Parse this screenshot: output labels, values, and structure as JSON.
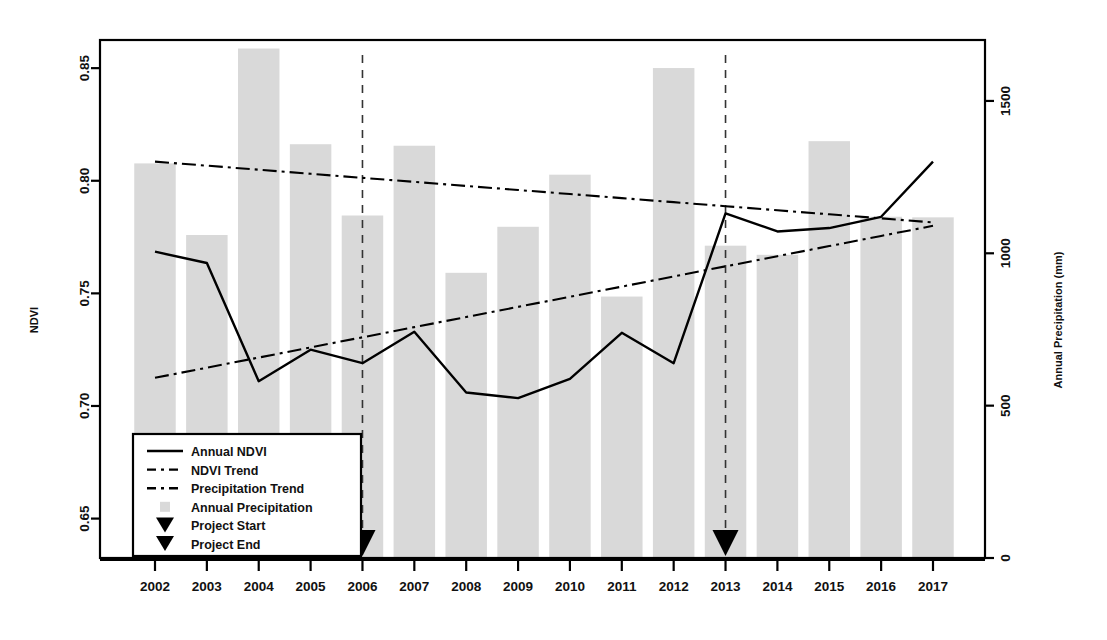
{
  "chart_data": {
    "type": "bar",
    "title": "",
    "xlabel": "",
    "ylabel": "NDVI",
    "y2label": "Annual Precipitation (mm)",
    "categories": [
      "2002",
      "2003",
      "2004",
      "2005",
      "2006",
      "2007",
      "2008",
      "2009",
      "2010",
      "2011",
      "2012",
      "2013",
      "2014",
      "2015",
      "2016",
      "2017"
    ],
    "ylim": [
      0.6325,
      0.8625
    ],
    "y2lim": [
      0,
      1700
    ],
    "yticks": [
      "0.65",
      "0.70",
      "0.75",
      "0.80",
      "0.85"
    ],
    "ytick_values": [
      0.65,
      0.7,
      0.75,
      0.8,
      0.85
    ],
    "y2ticks": [
      "0",
      "500",
      "1000",
      "1500"
    ],
    "y2tick_values": [
      0,
      500,
      1000,
      1500
    ],
    "grid": false,
    "legend_position": "bottom-left",
    "series": [
      {
        "name": "Annual Precipitation",
        "type": "bar",
        "axis": "right",
        "color": "#d9d9d9",
        "values": [
          1295,
          1060,
          1672,
          1358,
          1124,
          1353,
          936,
          1087,
          1258,
          858,
          1608,
          1025,
          995,
          1368,
          1120,
          1118
        ]
      },
      {
        "name": "Annual NDVI",
        "type": "line",
        "axis": "left",
        "color": "#000000",
        "values": [
          0.7685,
          0.7635,
          0.711,
          0.725,
          0.719,
          0.733,
          0.706,
          0.7035,
          0.712,
          0.7325,
          0.719,
          0.7855,
          0.7775,
          0.779,
          0.784,
          0.8085
        ]
      },
      {
        "name": "NDVI Trend",
        "type": "line",
        "axis": "left",
        "color": "#000000",
        "values": [
          0.8085,
          0.8067,
          0.8049,
          0.8031,
          0.8013,
          0.7995,
          0.7977,
          0.7959,
          0.7941,
          0.7923,
          0.7905,
          0.7887,
          0.7869,
          0.7851,
          0.7833,
          0.7815
        ]
      },
      {
        "name": "Precipitation Trend",
        "type": "line",
        "axis": "left",
        "color": "#000000",
        "values": [
          0.7125,
          0.717,
          0.7215,
          0.726,
          0.7305,
          0.735,
          0.7395,
          0.744,
          0.7485,
          0.753,
          0.7575,
          0.762,
          0.7665,
          0.771,
          0.7755,
          0.78
        ]
      }
    ],
    "annotations": [
      {
        "name": "Project Start",
        "x": "2006",
        "marker": "down-triangle",
        "vline": true
      },
      {
        "name": "Project End",
        "x": "2013",
        "marker": "down-triangle",
        "vline": true
      }
    ],
    "legend": [
      {
        "label": "Annual NDVI",
        "style": "solid-line"
      },
      {
        "label": "NDVI Trend",
        "style": "dash-dot-line"
      },
      {
        "label": "Precipitation Trend",
        "style": "dash-dot-line"
      },
      {
        "label": "Annual Precipitation",
        "style": "gray-square"
      },
      {
        "label": "Project Start",
        "style": "down-triangle"
      },
      {
        "label": "Project End",
        "style": "down-triangle"
      }
    ]
  }
}
